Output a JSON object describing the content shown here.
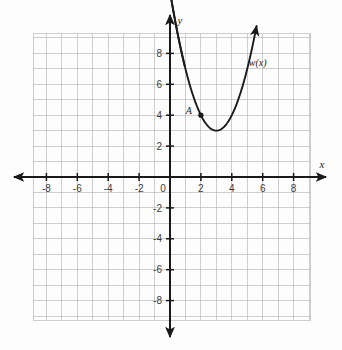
{
  "figure": {
    "kind": "coordinate-plane-graph",
    "background_color": "#fdfdfd",
    "grid_line_color": "#b9b9b9",
    "axis_color": "#1a1a1a",
    "curve_color": "#1a1a1a"
  },
  "axes": {
    "x_axis_name": "x",
    "y_axis_name": "y",
    "origin_label": "0",
    "x_ticks": [
      {
        "value": -8,
        "label": "-8"
      },
      {
        "value": -6,
        "label": "-6"
      },
      {
        "value": -4,
        "label": "-4"
      },
      {
        "value": -2,
        "label": "-2"
      },
      {
        "value": 2,
        "label": "2"
      },
      {
        "value": 4,
        "label": "4"
      },
      {
        "value": 6,
        "label": "6"
      },
      {
        "value": 8,
        "label": "8"
      }
    ],
    "y_ticks": [
      {
        "value": 8,
        "label": "8"
      },
      {
        "value": 6,
        "label": "6"
      },
      {
        "value": 4,
        "label": "4"
      },
      {
        "value": 2,
        "label": "2"
      },
      {
        "value": -2,
        "label": "-2"
      },
      {
        "value": -4,
        "label": "-4"
      },
      {
        "value": -6,
        "label": "-6"
      },
      {
        "value": -8,
        "label": "-8"
      }
    ]
  },
  "chart_data": {
    "type": "line",
    "title": "",
    "xlabel": "x",
    "ylabel": "y",
    "xlim": [
      -8.8,
      9.1
    ],
    "ylim": [
      -9.3,
      9.3
    ],
    "grid": true,
    "grid_step": 1,
    "tick_step": 2,
    "legend": "none",
    "series": [
      {
        "name": "w(x)",
        "label": "w(x)",
        "label_x": 5.1,
        "label_y": 7.2,
        "shape": "parabola",
        "vertex": [
          3,
          3
        ],
        "leading_coefficient": 1,
        "equation": "w(x) = (x - 3)^2 + 3",
        "x_start": -0.55,
        "x_end": 5.6,
        "arrow_start": true,
        "arrow_end": true,
        "x": [
          -0.55,
          0,
          0.5,
          1,
          1.5,
          2,
          2.5,
          3,
          3.5,
          4,
          4.5,
          5,
          5.5,
          5.6
        ],
        "y": [
          15.6,
          12,
          9.25,
          7,
          5.25,
          4,
          3.25,
          3,
          3.25,
          4,
          5.25,
          7,
          9.25,
          9.76
        ]
      }
    ],
    "annotations": [
      {
        "name": "A",
        "label": "A",
        "x": 2,
        "y": 4,
        "marker": "filled-dot",
        "label_offset_x": -12,
        "label_offset_y": -1
      }
    ]
  }
}
